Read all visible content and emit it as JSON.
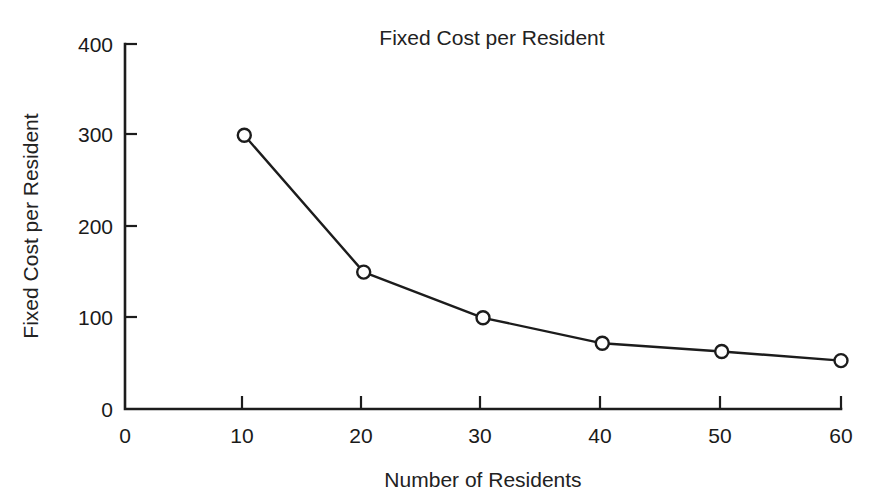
{
  "chart_data": {
    "type": "line",
    "title": "Fixed Cost per Resident",
    "xlabel": "Number of Residents",
    "ylabel": "Fixed Cost per Resident",
    "x": [
      10,
      20,
      30,
      40,
      50,
      60
    ],
    "values": [
      300,
      150,
      100,
      72,
      63,
      53
    ],
    "series": [
      {
        "name": "Fixed Cost per Resident",
        "x": [
          10,
          20,
          30,
          40,
          50,
          60
        ],
        "values": [
          300,
          150,
          100,
          72,
          63,
          53
        ]
      }
    ],
    "xlim": [
      0,
      60
    ],
    "ylim": [
      0,
      400
    ],
    "xticks": [
      0,
      10,
      20,
      30,
      40,
      50,
      60
    ],
    "yticks": [
      0,
      100,
      200,
      300,
      400
    ],
    "xtick_labels": [
      "0",
      "10",
      "20",
      "30",
      "40",
      "50",
      "60"
    ],
    "ytick_labels": [
      "0",
      "100",
      "200",
      "300",
      "400"
    ],
    "grid": false,
    "legend": false,
    "legend_position": "none",
    "marker": "open-circle",
    "line_color": "#1c1c1c",
    "marker_fill": "#ffffff",
    "background": "#ffffff"
  },
  "axes": {
    "x_tick_labels": [
      "0",
      "10",
      "20",
      "30",
      "40",
      "50",
      "60"
    ],
    "y_tick_labels": [
      "0",
      "100",
      "200",
      "300",
      "400"
    ],
    "x_axis_title": "Number of Residents",
    "y_axis_title": "Fixed Cost per Resident"
  },
  "header": {
    "title": "Fixed Cost per Resident"
  }
}
